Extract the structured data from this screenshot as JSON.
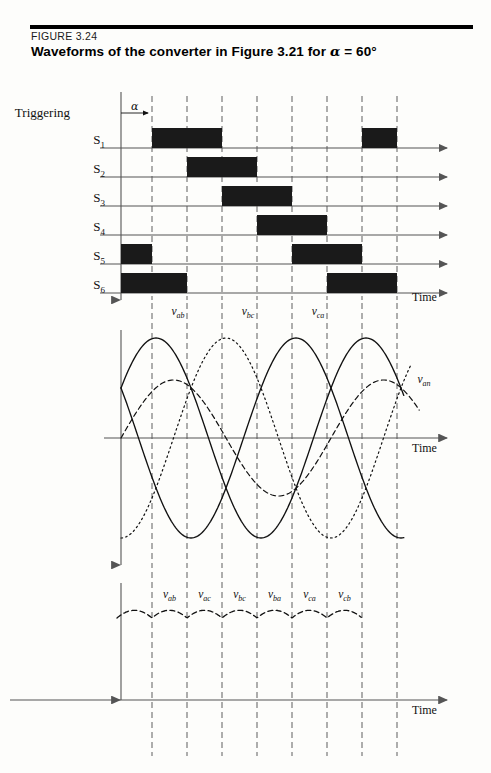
{
  "figure": {
    "number": "FIGURE 3.24",
    "title_prefix": "Waveforms of the converter in Figure 3.21 for ",
    "title_alpha": "α",
    "title_suffix": " = 60°",
    "title_full": "Waveforms of the converter in Figure 3.21 for α = 60°"
  },
  "panel_gating": {
    "group_label": "Triggering",
    "alpha_label": "α",
    "axis_label": "Time",
    "switch_labels": [
      "S",
      "S",
      "S",
      "S",
      "S",
      "S"
    ],
    "switch_subs": [
      "1",
      "2",
      "3",
      "4",
      "5",
      "6"
    ]
  },
  "panel_linevoltage": {
    "axis_label": "Time",
    "curve_labels": [
      "v",
      "v",
      "v",
      "v"
    ],
    "curve_subs": [
      "ab",
      "bc",
      "ca",
      "an"
    ]
  },
  "panel_ripple": {
    "axis_label": "Time",
    "segment_labels": [
      "v",
      "v",
      "v",
      "v",
      "v",
      "v"
    ],
    "segment_subs": [
      "ab",
      "ac",
      "bc",
      "ba",
      "ca",
      "cb"
    ]
  },
  "panel_bottom": {
    "axis_label": "Time"
  },
  "colors": {
    "ink": "#111111",
    "pulse_fill": "#1a1a1a",
    "axis": "#555555",
    "grid": "#666666",
    "rule": "#000000",
    "page": "#fdfdfb"
  },
  "chart_data": {
    "type": "line",
    "title": "Waveforms of the converter in Figure 3.21 for α = 60°",
    "xlabel": "Time",
    "ylabel": "",
    "grid": true,
    "firing_angle_deg": 60,
    "grid_x_px": [
      152,
      187,
      222,
      257,
      292,
      327,
      362,
      397
    ],
    "origin_x_px": 121,
    "panels": [
      {
        "name": "gating-pulses",
        "type": "bar",
        "description": "Six thyristor gate pulses, each 120 degrees wide, spaced 60 degrees apart, delayed by alpha = 60 degrees",
        "rows": [
          {
            "label": "S1",
            "baseline_y": 148,
            "pulses": [
              [
                152,
                222
              ],
              [
                362,
                397
              ]
            ]
          },
          {
            "label": "S2",
            "baseline_y": 177,
            "pulses": [
              [
                187,
                257
              ]
            ]
          },
          {
            "label": "S3",
            "baseline_y": 206,
            "pulses": [
              [
                222,
                292
              ]
            ]
          },
          {
            "label": "S4",
            "baseline_y": 235,
            "pulses": [
              [
                257,
                327
              ]
            ]
          },
          {
            "label": "S5",
            "baseline_y": 264,
            "pulses": [
              [
                121,
                152
              ],
              [
                292,
                362
              ]
            ]
          },
          {
            "label": "S6",
            "baseline_y": 293,
            "pulses": [
              [
                121,
                187
              ],
              [
                327,
                397
              ]
            ]
          }
        ]
      },
      {
        "name": "three-phase-line-voltages",
        "type": "line",
        "description": "Three line-to-line voltages vab, vbc, vca (period 210 px) plus phase voltage van",
        "axis_y": 438,
        "amplitude_px": 100,
        "period_px": 210,
        "series": [
          {
            "name": "vab",
            "style": "solid",
            "phase_deg": 30
          },
          {
            "name": "vbc",
            "style": "dotted",
            "phase_deg": -90
          },
          {
            "name": "vca",
            "style": "solid",
            "phase_deg": 150
          },
          {
            "name": "van",
            "style": "dashed",
            "phase_deg": 0,
            "amplitude_px": 58
          }
        ]
      },
      {
        "name": "output-ripple",
        "type": "line",
        "description": "Rectified six-pulse output voltage; cusps occur at each 60 degree commutation point",
        "axis_y": 620,
        "segments": [
          "vab",
          "vac",
          "vbc",
          "vba",
          "vca",
          "vcb"
        ]
      }
    ]
  }
}
